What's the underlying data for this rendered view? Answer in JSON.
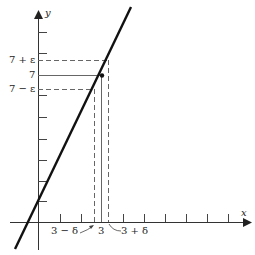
{
  "figure": {
    "axes": {
      "x_label": "x",
      "y_label": "y"
    },
    "y_labels": {
      "upper": "7 + ε",
      "center": "7",
      "lower": "7 − ε"
    },
    "x_labels": {
      "left": "3 − δ",
      "center": "3",
      "right": "3 + δ"
    },
    "point": {
      "x": 3,
      "y": 7
    },
    "colors": {
      "line": "#111111",
      "axis": "#333333",
      "dashed": "#666666"
    }
  }
}
